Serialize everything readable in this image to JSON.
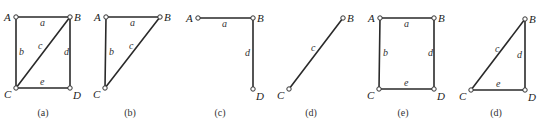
{
  "colors": {
    "edge": "#2a2a2a",
    "node_stroke": "#333333",
    "text": "#222222",
    "background": "#ffffff"
  },
  "panels": [
    {
      "id": "a",
      "caption": "(a)",
      "caption_pos": [
        43,
        116
      ],
      "vertices": [
        {
          "name": "A",
          "x": 16,
          "y": 17,
          "lx": 4,
          "ly": 17
        },
        {
          "name": "B",
          "x": 70,
          "y": 17,
          "lx": 74,
          "ly": 17
        },
        {
          "name": "C",
          "x": 16,
          "y": 88,
          "lx": 4,
          "ly": 94
        },
        {
          "name": "D",
          "x": 70,
          "y": 88,
          "lx": 73,
          "ly": 95
        }
      ],
      "edges": [
        {
          "label": "a",
          "from": [
            16,
            17
          ],
          "to": [
            70,
            17
          ],
          "lx": 40,
          "ly": 26
        },
        {
          "label": "b",
          "from": [
            16,
            17
          ],
          "to": [
            16,
            88
          ],
          "lx": 19,
          "ly": 55
        },
        {
          "label": "c",
          "from": [
            70,
            17
          ],
          "to": [
            16,
            88
          ],
          "lx": 38,
          "ly": 49
        },
        {
          "label": "d",
          "from": [
            70,
            17
          ],
          "to": [
            70,
            88
          ],
          "lx": 64,
          "ly": 55
        },
        {
          "label": "e",
          "from": [
            16,
            88
          ],
          "to": [
            70,
            88
          ],
          "lx": 40,
          "ly": 85
        }
      ]
    },
    {
      "id": "b",
      "caption": "(b)",
      "caption_pos": [
        130,
        116
      ],
      "vertices": [
        {
          "name": "A",
          "x": 106,
          "y": 17,
          "lx": 94,
          "ly": 17
        },
        {
          "name": "B",
          "x": 160,
          "y": 17,
          "lx": 164,
          "ly": 17
        },
        {
          "name": "C",
          "x": 105,
          "y": 88,
          "lx": 93,
          "ly": 94
        }
      ],
      "edges": [
        {
          "label": "a",
          "from": [
            106,
            17
          ],
          "to": [
            160,
            17
          ],
          "lx": 130,
          "ly": 26
        },
        {
          "label": "b",
          "from": [
            106,
            17
          ],
          "to": [
            105,
            88
          ],
          "lx": 109,
          "ly": 55
        },
        {
          "label": "c",
          "from": [
            160,
            17
          ],
          "to": [
            105,
            88
          ],
          "lx": 129,
          "ly": 49
        }
      ]
    },
    {
      "id": "c",
      "caption": "(c)",
      "caption_pos": [
        220,
        116
      ],
      "vertices": [
        {
          "name": "A",
          "x": 198,
          "y": 18,
          "lx": 186,
          "ly": 18
        },
        {
          "name": "B",
          "x": 253,
          "y": 18,
          "lx": 257,
          "ly": 18
        },
        {
          "name": "D",
          "x": 253,
          "y": 89,
          "lx": 256,
          "ly": 96
        }
      ],
      "edges": [
        {
          "label": "a",
          "from": [
            198,
            18
          ],
          "to": [
            253,
            18
          ],
          "lx": 222,
          "ly": 27
        },
        {
          "label": "d",
          "from": [
            253,
            18
          ],
          "to": [
            253,
            89
          ],
          "lx": 245,
          "ly": 56
        }
      ]
    },
    {
      "id": "d",
      "caption": "(d)",
      "caption_pos": [
        311,
        116
      ],
      "vertices": [
        {
          "name": "B",
          "x": 343,
          "y": 18,
          "lx": 347,
          "ly": 18
        },
        {
          "name": "C",
          "x": 289,
          "y": 89,
          "lx": 277,
          "ly": 95
        }
      ],
      "edges": [
        {
          "label": "c",
          "from": [
            343,
            18
          ],
          "to": [
            289,
            89
          ],
          "lx": 311,
          "ly": 51
        }
      ]
    },
    {
      "id": "e",
      "caption": "(e)",
      "caption_pos": [
        403,
        116
      ],
      "vertices": [
        {
          "name": "A",
          "x": 380,
          "y": 18,
          "lx": 368,
          "ly": 18
        },
        {
          "name": "B",
          "x": 434,
          "y": 18,
          "lx": 438,
          "ly": 18
        },
        {
          "name": "C",
          "x": 379,
          "y": 89,
          "lx": 367,
          "ly": 95
        },
        {
          "name": "D",
          "x": 434,
          "y": 89,
          "lx": 437,
          "ly": 96
        }
      ],
      "edges": [
        {
          "label": "a",
          "from": [
            380,
            18
          ],
          "to": [
            434,
            18
          ],
          "lx": 404,
          "ly": 27
        },
        {
          "label": "b",
          "from": [
            380,
            18
          ],
          "to": [
            379,
            89
          ],
          "lx": 383,
          "ly": 56
        },
        {
          "label": "d",
          "from": [
            434,
            18
          ],
          "to": [
            434,
            89
          ],
          "lx": 428,
          "ly": 56
        },
        {
          "label": "e",
          "from": [
            379,
            89
          ],
          "to": [
            434,
            89
          ],
          "lx": 404,
          "ly": 86
        }
      ]
    },
    {
      "id": "d2",
      "caption": "(d)",
      "caption_pos": [
        496,
        116
      ],
      "vertices": [
        {
          "name": "B",
          "x": 525,
          "y": 19,
          "lx": 529,
          "ly": 19
        },
        {
          "name": "C",
          "x": 471,
          "y": 90,
          "lx": 459,
          "ly": 96
        },
        {
          "name": "D",
          "x": 525,
          "y": 90,
          "lx": 528,
          "ly": 97
        }
      ],
      "edges": [
        {
          "label": "c",
          "from": [
            525,
            19
          ],
          "to": [
            471,
            90
          ],
          "lx": 495,
          "ly": 52
        },
        {
          "label": "d",
          "from": [
            525,
            19
          ],
          "to": [
            525,
            90
          ],
          "lx": 517,
          "ly": 58
        },
        {
          "label": "e",
          "from": [
            471,
            90
          ],
          "to": [
            525,
            90
          ],
          "lx": 496,
          "ly": 87
        }
      ]
    }
  ]
}
